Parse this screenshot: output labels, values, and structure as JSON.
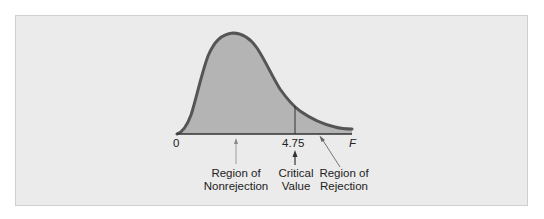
{
  "figure": {
    "type": "F-distribution diagram",
    "axis": {
      "origin_label": "0",
      "critical_label": "4.75",
      "variable_label": "F"
    },
    "annotations": {
      "nonrejection_line1": "Region of",
      "nonrejection_line2": "Nonrejection",
      "critical_line1": "Critical",
      "critical_line2": "Value",
      "rejection_line1": "Region of",
      "rejection_line2": "Rejection"
    },
    "colors": {
      "panel_background": "#ebebeb",
      "area_fill": "#b4b4b4",
      "curve_stroke": "#555555",
      "axis": "#333333"
    }
  }
}
